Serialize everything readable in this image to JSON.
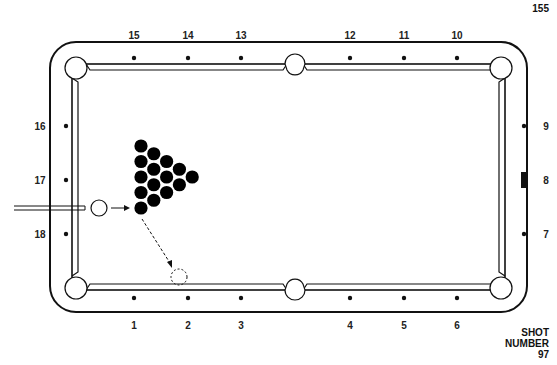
{
  "page": {
    "number": "155"
  },
  "shot": {
    "label_line1": "SHOT",
    "label_line2": "NUMBER",
    "number": "97"
  },
  "diamonds": {
    "top": [
      {
        "label": "15",
        "x": 134
      },
      {
        "label": "14",
        "x": 188
      },
      {
        "label": "13",
        "x": 241
      },
      {
        "label": "12",
        "x": 350
      },
      {
        "label": "11",
        "x": 404
      },
      {
        "label": "10",
        "x": 457
      }
    ],
    "bottom": [
      {
        "label": "1",
        "x": 134
      },
      {
        "label": "2",
        "x": 188
      },
      {
        "label": "3",
        "x": 241
      },
      {
        "label": "4",
        "x": 350
      },
      {
        "label": "5",
        "x": 404
      },
      {
        "label": "6",
        "x": 457
      }
    ],
    "left": [
      {
        "label": "16",
        "y": 126
      },
      {
        "label": "17",
        "y": 180
      },
      {
        "label": "18",
        "y": 234
      }
    ],
    "right": [
      {
        "label": "9",
        "y": 126,
        "marker": "dot"
      },
      {
        "label": "8",
        "y": 180,
        "marker": "bar"
      },
      {
        "label": "7",
        "y": 234,
        "marker": "dot"
      }
    ]
  },
  "balls": {
    "cue_ball": {
      "x": 99,
      "y": 208,
      "r": 8
    },
    "ghost_ball": {
      "x": 179,
      "y": 277,
      "r": 8
    },
    "rack_count": 15,
    "rack_color": "#000000"
  },
  "colors": {
    "line": "#111111",
    "background": "#ffffff"
  }
}
